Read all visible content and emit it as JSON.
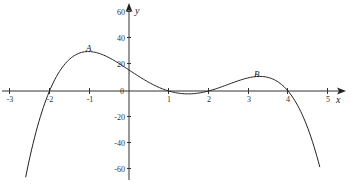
{
  "chart_data": {
    "type": "line",
    "title": "",
    "xlabel": "x",
    "ylabel": "y",
    "xlim": [
      -3.2,
      5.5
    ],
    "ylim": [
      -68,
      66
    ],
    "grid": false,
    "x_ticks": [
      -3,
      -2,
      -1,
      0,
      1,
      2,
      3,
      4,
      5
    ],
    "x_tick_labels": [
      "-3",
      "-2",
      "-1",
      "0",
      "1",
      "2",
      "3",
      "4",
      "5"
    ],
    "y_ticks": [
      60,
      40,
      20,
      0,
      -20,
      -40,
      -60
    ],
    "y_tick_labels": [
      "60",
      "40",
      "20",
      "0",
      "-20",
      "-40",
      "-60"
    ],
    "series": [
      {
        "name": "f(x)",
        "description": "quartic curve with roots at -2, 1, 2, 4",
        "x": [
          -2.6,
          -2.4,
          -2.2,
          -2.0,
          -1.8,
          -1.6,
          -1.4,
          -1.2,
          -1.0,
          -0.8,
          -0.6,
          -0.4,
          -0.2,
          0.0,
          0.2,
          0.4,
          0.6,
          0.8,
          1.0,
          1.2,
          1.4,
          1.6,
          1.8,
          2.0,
          2.2,
          2.4,
          2.6,
          2.8,
          3.0,
          3.2,
          3.4,
          3.6,
          3.8,
          4.0,
          4.2,
          4.4,
          4.6,
          4.8
        ],
        "y": [
          -65.6,
          -40.8,
          -19.4,
          0.0,
          15.2,
          25.0,
          29.9,
          30.5,
          30.0,
          27.3,
          23.7,
          19.7,
          16.0,
          16.0,
          11.7,
          7.6,
          4.0,
          1.3,
          0.0,
          -1.6,
          -2.3,
          -2.0,
          -1.1,
          0.0,
          2.5,
          5.3,
          7.9,
          9.9,
          10.0,
          11.0,
          9.2,
          6.1,
          2.8,
          0.0,
          -5.0,
          -16.5,
          -37.1,
          -59.0
        ]
      }
    ],
    "annotations": [
      {
        "label": "A",
        "x": -1.0,
        "y": 30,
        "description": "local maximum"
      },
      {
        "label": "B",
        "x": 3.2,
        "y": 11,
        "description": "local maximum"
      }
    ]
  },
  "labels": {
    "x_axis": "x",
    "y_axis": "y",
    "point_a": "A",
    "point_b": "B",
    "ticks_x": [
      "-3",
      "-2",
      "-1",
      "1",
      "2",
      "3",
      "4",
      "5"
    ],
    "tick_zero": "0",
    "ticks_y": [
      "60",
      "40",
      "20",
      "-20",
      "-40",
      "-60"
    ]
  }
}
